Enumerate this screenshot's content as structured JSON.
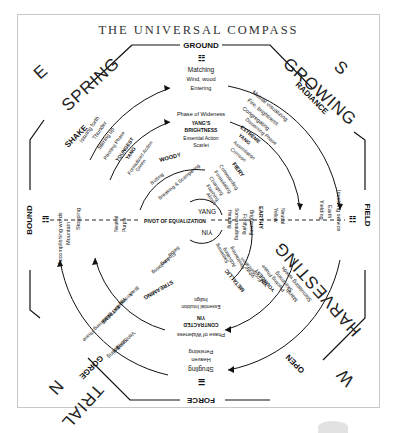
{
  "title": "THE UNIVERSAL COMPASS",
  "directions": {
    "top_left_letter": "E",
    "top_right_letter": "S",
    "bottom_left_letter": "N",
    "bottom_right_letter": "W"
  },
  "seasons": {
    "top_left": "SPRING",
    "top_right": "GROWING",
    "bottom_right": "HARVESTING",
    "bottom_left": "TRIAL"
  },
  "trigrams": {
    "top": {
      "name": "GROUND",
      "symbol": "☷"
    },
    "top_right": {
      "name": "RADIANCE",
      "symbol": "☲"
    },
    "right": {
      "name": "FIELD",
      "symbol": "☷"
    },
    "bottom_right": {
      "name": "OPEN",
      "symbol": "☱"
    },
    "bottom": {
      "name": "FORCE",
      "symbol": "☰"
    },
    "bottom_left": {
      "name": "GORGE",
      "symbol": "☵"
    },
    "left": {
      "name": "BOUND",
      "symbol": "☶"
    },
    "top_left": {
      "name": "SHAKE",
      "symbol": "☳"
    }
  },
  "outer_ring": {
    "top": [
      "Matching",
      "Wind, wood",
      "Entering"
    ],
    "top_right": [
      "Mutual visualizing",
      "Fire, brightness",
      "Congregating"
    ],
    "right": [
      "Involving service",
      "Earth",
      "Yielding"
    ],
    "bottom_right": [
      "Stimulating words",
      "Marsh",
      "Skimming"
    ],
    "bottom": [
      "Strugling",
      "Heaven",
      "Persisting"
    ],
    "bottom_left": [
      "Toiling",
      "Stream",
      "Venturing"
    ],
    "left": [
      "Accomplishing words",
      "Mountain",
      "Stopping"
    ],
    "top_left": [
      "Issuing forth",
      "Thunder",
      "Stirring up"
    ]
  },
  "middle_ring": {
    "top": [
      "Phase of Wideness",
      "YANG'S",
      "BRIGHTNESS",
      "Essential Action",
      "Scarlet"
    ],
    "top_right": [
      "Discerning Phase",
      "EXTREME",
      "YANG",
      "Assimilation",
      "Crimson"
    ],
    "right": [
      "Neutral",
      "Yellow"
    ],
    "bottom_right": [
      "Pivoting Phase",
      "YOUNGEST",
      "YIN",
      "Formulization",
      "White"
    ],
    "bottom": [
      "Phase of Wideness",
      "CONTRACTED",
      "YIN",
      "Essential Intuition",
      "Indigo"
    ],
    "bottom_left": [
      "Discerning Phase",
      "EXTREME",
      "YIN",
      "Assimilation",
      "Black"
    ],
    "left": [
      "Neutral",
      "Purple"
    ],
    "top_left": [
      "Pivoting Phase",
      "YOUNGEST",
      "YANG",
      "Formulized Action",
      "Green"
    ]
  },
  "inner_ring": {
    "top_left": "WOODY",
    "top_left_sub": [
      "Butting",
      "Breaking & Scampering"
    ],
    "top_right": "FIERY",
    "top_right_sub": [
      "Commanding",
      "Formulating",
      "Changing",
      "Flashing",
      "Above"
    ],
    "right": "EARTHY",
    "right_sub": [
      "Brightening",
      "Fortifying"
    ],
    "bottom_right": "METALLIC",
    "bottom_right_sub": [
      "Restraining",
      "Activating",
      "Skimming"
    ],
    "bottom_left": "STREAMING",
    "bottom_left_sub": [
      "Levitating",
      "Floating",
      "Below"
    ],
    "center_right_sub": [
      "Somersaulting",
      "Heading"
    ]
  },
  "center": {
    "yang": "YANG",
    "yin": "YIN",
    "axis_label": "PIVOT OF EQUALIZATION"
  }
}
